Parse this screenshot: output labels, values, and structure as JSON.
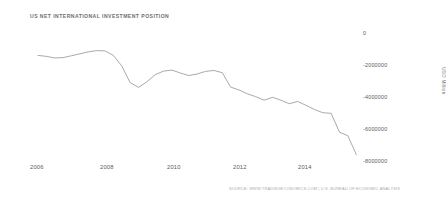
{
  "chart_data": {
    "type": "line",
    "title": "US NET INTERNATIONAL INVESTMENT POSITION",
    "xlabel": "",
    "ylabel": "USD Million",
    "source": "SOURCE: WWW.TRADINGECONOMICS.COM | U.S. BUREAU OF ECONOMIC ANALYSIS",
    "grid": false,
    "legend": "none",
    "line_color": "#999999",
    "xlim": [
      2006.0,
      2015.5
    ],
    "ylim": [
      -8000000,
      0
    ],
    "xticks": [
      "2006",
      "2008",
      "2010",
      "2012",
      "2014"
    ],
    "xtick_values": [
      2006,
      2008,
      2010,
      2012,
      2014
    ],
    "yticks": [
      "0",
      "-2000000",
      "-4000000",
      "-6000000",
      "-8000000"
    ],
    "ytick_values": [
      0,
      -2000000,
      -4000000,
      -6000000,
      -8000000
    ],
    "series": [
      {
        "name": "US Net International Investment Position",
        "x": [
          2006.0,
          2006.25,
          2006.5,
          2006.75,
          2007.0,
          2007.25,
          2007.5,
          2007.75,
          2008.0,
          2008.25,
          2008.5,
          2008.75,
          2009.0,
          2009.25,
          2009.5,
          2009.75,
          2010.0,
          2010.25,
          2010.5,
          2010.75,
          2011.0,
          2011.25,
          2011.5,
          2011.75,
          2012.0,
          2012.25,
          2012.5,
          2012.75,
          2013.0,
          2013.25,
          2013.5,
          2013.75,
          2014.0,
          2014.25,
          2014.5,
          2014.75,
          2015.0,
          2015.25
        ],
        "values": [
          -1400000,
          -1460000,
          -1560000,
          -1540000,
          -1420000,
          -1300000,
          -1180000,
          -1100000,
          -1120000,
          -1400000,
          -2060000,
          -3100000,
          -3400000,
          -3050000,
          -2600000,
          -2380000,
          -2320000,
          -2500000,
          -2660000,
          -2560000,
          -2400000,
          -2340000,
          -2480000,
          -3380000,
          -3560000,
          -3800000,
          -3980000,
          -4200000,
          -4020000,
          -4200000,
          -4420000,
          -4280000,
          -4520000,
          -4780000,
          -4980000,
          -5020000,
          -6200000,
          -6420000
        ],
        "end_value": -7600000
      }
    ]
  },
  "chart": {
    "title": "US NET INTERNATIONAL INVESTMENT POSITION",
    "ylabel": "USD Million",
    "source": "SOURCE: WWW.TRADINGECONOMICS.COM | U.S. BUREAU OF ECONOMIC ANALYSIS",
    "ytick_0": "0",
    "ytick_1": "-2000000",
    "ytick_2": "-4000000",
    "ytick_3": "-6000000",
    "ytick_4": "-8000000",
    "xtick_0": "2006",
    "xtick_1": "2008",
    "xtick_2": "2010",
    "xtick_3": "2012",
    "xtick_4": "2014"
  }
}
